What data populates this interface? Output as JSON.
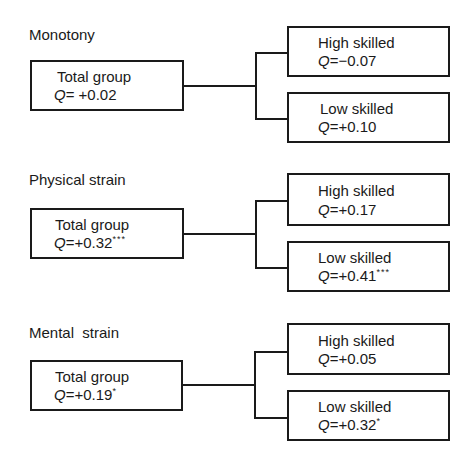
{
  "diagram": {
    "sections": [
      {
        "title": "Monotony",
        "total": {
          "label": "Total group",
          "q_prefix": "Q",
          "q_value": "= +0.02",
          "sig": ""
        },
        "high": {
          "label": "High skilled",
          "q_prefix": "Q",
          "q_value": "=−0.07",
          "sig": ""
        },
        "low": {
          "label": "Low skilled",
          "q_prefix": "Q",
          "q_value": "=+0.10",
          "sig": ""
        }
      },
      {
        "title": "Physical strain",
        "total": {
          "label": "Total group",
          "q_prefix": "Q",
          "q_value": "=+0.32",
          "sig": "***"
        },
        "high": {
          "label": "High skilled",
          "q_prefix": "Q",
          "q_value": "=+0.17",
          "sig": ""
        },
        "low": {
          "label": "Low skilled",
          "q_prefix": "Q",
          "q_value": "=+0.41",
          "sig": "***"
        }
      },
      {
        "title": "Mental  strain",
        "total": {
          "label": "Total group",
          "q_prefix": "Q",
          "q_value": "=+0.19",
          "sig": "*"
        },
        "high": {
          "label": "High skilled",
          "q_prefix": "Q",
          "q_value": "=+0.05",
          "sig": ""
        },
        "low": {
          "label": "Low skilled",
          "q_prefix": "Q",
          "q_value": "=+0.32",
          "sig": "*"
        }
      }
    ]
  }
}
